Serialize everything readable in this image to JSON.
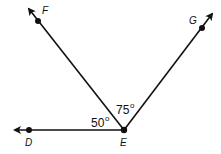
{
  "diagram": {
    "vertex": {
      "label": "E",
      "x": 124,
      "y": 130
    },
    "rays": [
      {
        "name": "ray-ed",
        "point_label": "D",
        "point": [
          29,
          130
        ],
        "tip": [
          15,
          130
        ],
        "label_pos": [
          25,
          146
        ]
      },
      {
        "name": "ray-ef",
        "point_label": "F",
        "point": [
          38,
          21
        ],
        "tip": [
          29,
          9
        ],
        "label_pos": [
          42,
          14
        ]
      },
      {
        "name": "ray-eg",
        "point_label": "G",
        "point": [
          202,
          28
        ],
        "tip": [
          212,
          14
        ],
        "label_pos": [
          188,
          24
        ]
      }
    ],
    "angles": [
      {
        "name": "angle-def",
        "value": "50",
        "unit": "o",
        "label_pos": [
          91,
          127
        ]
      },
      {
        "name": "angle-feg",
        "value": "75",
        "unit": "o",
        "label_pos": [
          116,
          114
        ]
      }
    ],
    "colors": {
      "stroke": "#111111",
      "background": "#ffffff"
    }
  }
}
